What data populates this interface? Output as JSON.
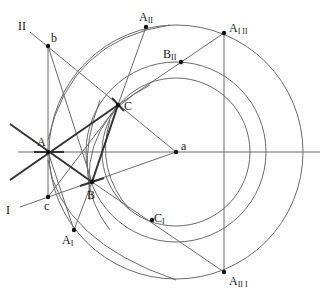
{
  "figure": {
    "type": "geometric-construction",
    "background": "#ffffff",
    "line_color": "#6a6a6a",
    "thick_line_color": "#333333",
    "points": [
      {
        "id": "a",
        "label": "a",
        "sub": "",
        "x": 176,
        "y": 152
      },
      {
        "id": "A",
        "label": "A",
        "sub": "",
        "x": 48,
        "y": 152
      },
      {
        "id": "B",
        "label": "B",
        "sub": "",
        "x": 92,
        "y": 182
      },
      {
        "id": "C",
        "label": "C",
        "sub": "",
        "x": 118,
        "y": 105
      },
      {
        "id": "b",
        "label": "b",
        "sub": "",
        "x": 48,
        "y": 46
      },
      {
        "id": "c",
        "label": "c",
        "sub": "",
        "x": 48,
        "y": 197
      },
      {
        "id": "A_II",
        "label": "A",
        "sub": "II",
        "x": 146,
        "y": 27
      },
      {
        "id": "A_I_II",
        "label": "A",
        "sub": "I II",
        "x": 224,
        "y": 33
      },
      {
        "id": "B_II",
        "label": "B",
        "sub": "II",
        "x": 181,
        "y": 62
      },
      {
        "id": "A_I",
        "label": "A",
        "sub": "I",
        "x": 74,
        "y": 230
      },
      {
        "id": "C_I",
        "label": "C",
        "sub": "I",
        "x": 152,
        "y": 220
      },
      {
        "id": "A_II_I",
        "label": "A",
        "sub": "II I",
        "x": 224,
        "y": 272
      }
    ],
    "line_labels": [
      {
        "id": "II",
        "label": "II",
        "x": 18,
        "y": 28
      },
      {
        "id": "I",
        "label": "I",
        "x": 6,
        "y": 213
      }
    ],
    "circles_centered_at_a": [
      {
        "r": 127
      },
      {
        "r": 90
      },
      {
        "r": 74
      }
    ]
  }
}
